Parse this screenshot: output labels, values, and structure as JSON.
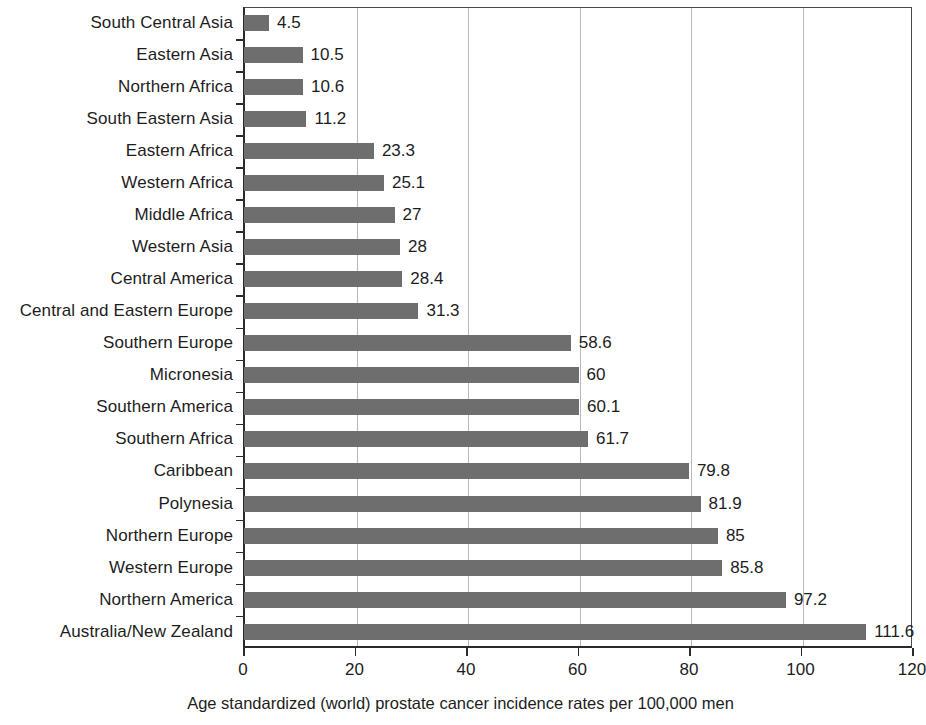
{
  "chart_data": {
    "type": "bar",
    "orientation": "horizontal",
    "title": "",
    "subtitle": "",
    "xlabel": "Age standardized (world) prostate cancer incidence rates per 100,000 men",
    "ylabel": "",
    "xlim": [
      0,
      120
    ],
    "xticks": [
      0,
      20,
      40,
      60,
      80,
      100,
      120
    ],
    "xtick_labels": [
      "0",
      "20",
      "40",
      "60",
      "80",
      "100",
      "120"
    ],
    "grid": "vertical",
    "legend": "none",
    "bar_color": "#6e6e6e",
    "value_labels_shown": true,
    "categories": [
      "South Central Asia",
      "Eastern Asia",
      "Northern Africa",
      "South Eastern Asia",
      "Eastern Africa",
      "Western Africa",
      "Middle Africa",
      "Western Asia",
      "Central America",
      "Central and Eastern Europe",
      "Southern Europe",
      "Micronesia",
      "Southern America",
      "Southern Africa",
      "Caribbean",
      "Polynesia",
      "Northern Europe",
      "Western Europe",
      "Northern America",
      "Australia/New Zealand"
    ],
    "values": [
      4.5,
      10.5,
      10.6,
      11.2,
      23.3,
      25.1,
      27,
      28,
      28.4,
      31.3,
      58.6,
      60,
      60.1,
      61.7,
      79.8,
      81.9,
      85,
      85.8,
      97.2,
      111.6
    ],
    "value_labels": [
      "4.5",
      "10.5",
      "10.6",
      "11.2",
      "23.3",
      "25.1",
      "27",
      "28",
      "28.4",
      "31.3",
      "58.6",
      "60",
      "60.1",
      "61.7",
      "79.8",
      "81.9",
      "85",
      "85.8",
      "97.2",
      "111.6"
    ]
  }
}
